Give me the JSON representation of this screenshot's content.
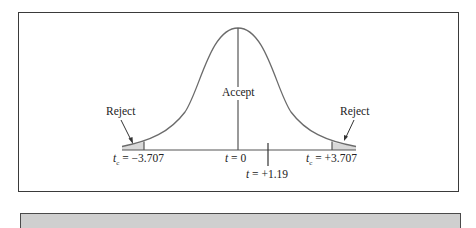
{
  "figure": {
    "type": "t-distribution hypothesis test diagram",
    "regions": {
      "left_reject_label": "Reject",
      "accept_label": "Accept",
      "right_reject_label": "Reject"
    },
    "axis_labels": {
      "left_critical": {
        "var": "t",
        "sub": "c",
        "text": " = −3.707"
      },
      "center": {
        "var": "t",
        "text": " = 0"
      },
      "right_critical": {
        "var": "t",
        "sub": "c",
        "text": " = +3.707"
      },
      "observed": {
        "var": "t",
        "text": " = +1.19"
      }
    },
    "values": {
      "critical_value": 3.707,
      "observed_t": 1.19,
      "mean": 0
    },
    "colors": {
      "curve": "#6b6b6b",
      "shade": "#d9d9d9",
      "frame": "#3a3a3a",
      "gray_bar": "#cfcfcf"
    }
  }
}
